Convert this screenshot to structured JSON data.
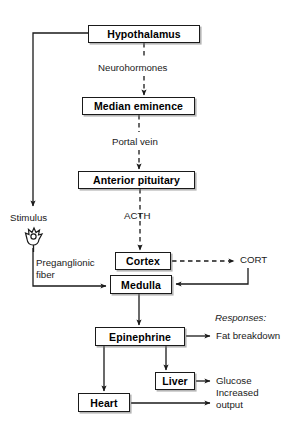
{
  "diagram": {
    "background_color": "#ffffff",
    "line_color": "#1a1a1a",
    "box_fill": "#ffffff",
    "nodes": [
      {
        "id": "hypothalamus",
        "label": "Hypothalamus",
        "x": 88,
        "y": 25,
        "w": 112,
        "h": 18
      },
      {
        "id": "median_eminence",
        "label": "Median eminence",
        "x": 82,
        "y": 97,
        "w": 113,
        "h": 18
      },
      {
        "id": "anterior_pituitary",
        "label": "Anterior pituitary",
        "x": 78,
        "y": 171,
        "w": 117,
        "h": 18
      },
      {
        "id": "cortex",
        "label": "Cortex",
        "x": 115,
        "y": 252,
        "w": 56,
        "h": 18
      },
      {
        "id": "medulla",
        "label": "Medulla",
        "x": 110,
        "y": 275,
        "w": 62,
        "h": 19
      },
      {
        "id": "epinephrine",
        "label": "Epinephrine",
        "x": 95,
        "y": 327,
        "w": 90,
        "h": 19
      },
      {
        "id": "liver",
        "label": "Liver",
        "x": 155,
        "y": 372,
        "w": 40,
        "h": 18
      },
      {
        "id": "heart",
        "label": "Heart",
        "x": 78,
        "y": 393,
        "w": 52,
        "h": 19
      }
    ],
    "labels": [
      {
        "id": "neurohormones",
        "text": "Neurohormones",
        "x": 98,
        "y": 62,
        "italic": false,
        "wrap": false
      },
      {
        "id": "portal_vein",
        "text": "Portal vein",
        "x": 112,
        "y": 136,
        "italic": false,
        "wrap": false
      },
      {
        "id": "acth",
        "text": "ACTH",
        "x": 124,
        "y": 210,
        "italic": false,
        "wrap": false
      },
      {
        "id": "stimulus",
        "text": "Stimulus",
        "x": 10,
        "y": 212,
        "italic": false,
        "wrap": false
      },
      {
        "id": "preganglionic_fiber",
        "text": "Preganglionic fiber",
        "x": 36,
        "y": 257,
        "italic": false,
        "wrap": true
      },
      {
        "id": "cort",
        "text": "CORT",
        "x": 240,
        "y": 254,
        "italic": false,
        "wrap": false
      },
      {
        "id": "responses",
        "text": "Responses:",
        "x": 215,
        "y": 312,
        "italic": true,
        "wrap": false
      },
      {
        "id": "fat_breakdown",
        "text": "Fat breakdown",
        "x": 216,
        "y": 330,
        "italic": false,
        "wrap": false
      },
      {
        "id": "glucose",
        "text": "Glucose",
        "x": 216,
        "y": 375,
        "italic": false,
        "wrap": false
      },
      {
        "id": "increased_output",
        "text": "Increased output",
        "x": 216,
        "y": 387,
        "italic": false,
        "wrap": true
      }
    ],
    "edges": [
      {
        "id": "hypothalamus-to-median-eminence",
        "style": "dashed",
        "label": "Neurohormones"
      },
      {
        "id": "median-eminence-to-anterior-pituitary",
        "style": "dashed",
        "label": "Portal vein"
      },
      {
        "id": "anterior-pituitary-to-cortex",
        "style": "dashed",
        "label": "ACTH"
      },
      {
        "id": "cortex-to-cort",
        "style": "dashed",
        "label": ""
      },
      {
        "id": "cort-to-medulla",
        "style": "solid",
        "label": ""
      },
      {
        "id": "hypothalamus-to-stimulus",
        "style": "solid",
        "label": ""
      },
      {
        "id": "stimulus-to-medulla",
        "style": "solid",
        "label": "Preganglionic fiber"
      },
      {
        "id": "medulla-to-epinephrine",
        "style": "solid",
        "label": ""
      },
      {
        "id": "epinephrine-to-fat-breakdown",
        "style": "solid",
        "label": "Fat breakdown"
      },
      {
        "id": "epinephrine-to-liver",
        "style": "solid",
        "label": ""
      },
      {
        "id": "epinephrine-to-heart",
        "style": "solid",
        "label": ""
      },
      {
        "id": "liver-to-glucose",
        "style": "solid",
        "label": "Glucose"
      },
      {
        "id": "heart-to-increased-output",
        "style": "solid",
        "label": "Increased output"
      }
    ],
    "icons": [
      {
        "id": "sensory-receptor-icon",
        "x": 28,
        "y": 226
      }
    ]
  }
}
